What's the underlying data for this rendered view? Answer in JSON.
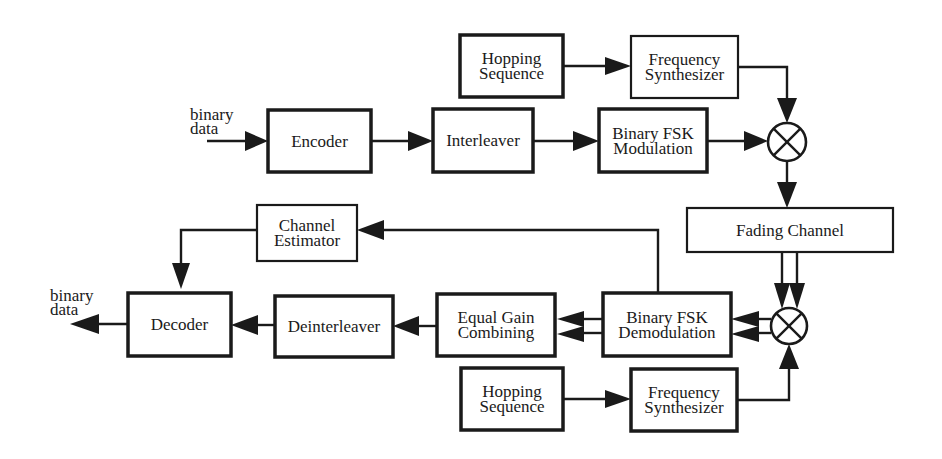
{
  "diagram": {
    "colors": {
      "ink": "#1a1a1a",
      "background": "#ffffff"
    },
    "input": {
      "line1": "binary",
      "line2": "data"
    },
    "output": {
      "line1": "binary",
      "line2": "data"
    },
    "blocks": {
      "hopping_top": {
        "line1": "Hopping",
        "line2": "Sequence"
      },
      "synth_top": {
        "line1": "Frequency",
        "line2": "Synthesizer"
      },
      "encoder": {
        "line1": "Encoder"
      },
      "interleaver": {
        "line1": "Interleaver"
      },
      "fsk_mod": {
        "line1": "Binary FSK",
        "line2": "Modulation"
      },
      "fading_channel": {
        "line1": "Fading Channel"
      },
      "channel_estimator": {
        "line1": "Channel",
        "line2": "Estimator"
      },
      "decoder": {
        "line1": "Decoder"
      },
      "deinterleaver": {
        "line1": "Deinterleaver"
      },
      "egc": {
        "line1": "Equal Gain",
        "line2": "Combining"
      },
      "fsk_demod": {
        "line1": "Binary FSK",
        "line2": "Demodulation"
      },
      "hopping_bottom": {
        "line1": "Hopping",
        "line2": "Sequence"
      },
      "synth_bottom": {
        "line1": "Frequency",
        "line2": "Synthesizer"
      }
    },
    "mixers": [
      {
        "id": "mixer-top",
        "symbol": "⊗"
      },
      {
        "id": "mixer-bottom",
        "symbol": "⊗"
      }
    ],
    "connections": [
      "binary data -> Encoder",
      "Encoder -> Interleaver",
      "Interleaver -> Binary FSK Modulation",
      "Binary FSK Modulation -> mixer-top",
      "Hopping Sequence (top) -> Frequency Synthesizer (top)",
      "Frequency Synthesizer (top) -> mixer-top",
      "mixer-top -> Fading Channel",
      "Fading Channel => mixer-bottom (2 branches)",
      "Hopping Sequence (bottom) -> Frequency Synthesizer (bottom)",
      "Frequency Synthesizer (bottom) -> mixer-bottom",
      "mixer-bottom => Binary FSK Demodulation (2 branches)",
      "Binary FSK Demodulation => Equal Gain Combining (2 branches)",
      "Binary FSK Demodulation -> Channel Estimator",
      "Channel Estimator -> Decoder",
      "Equal Gain Combining -> Deinterleaver",
      "Deinterleaver -> Decoder",
      "Decoder -> binary data"
    ]
  }
}
